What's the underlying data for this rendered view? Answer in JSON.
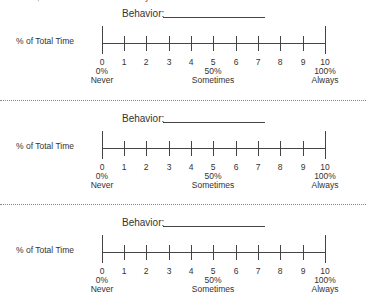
{
  "intro_text": "If desired, an additional behavior may be defined and rated.",
  "scales": [
    {
      "behavior_label": "Behavior:",
      "behavior_value": "",
      "y_label": "% of Total Time"
    },
    {
      "behavior_label": "Behavior:",
      "behavior_value": "",
      "y_label": "% of Total Time"
    },
    {
      "behavior_label": "Behavior:",
      "behavior_value": "",
      "y_label": "% of Total Time"
    }
  ],
  "ticks": [
    "0",
    "1",
    "2",
    "3",
    "4",
    "5",
    "6",
    "7",
    "8",
    "9",
    "10"
  ],
  "anchors": {
    "low": {
      "percent": "0%",
      "label": "Never"
    },
    "mid": {
      "percent": "50%",
      "label": "Sometimes"
    },
    "high": {
      "percent": "100%",
      "label": "Always"
    }
  }
}
